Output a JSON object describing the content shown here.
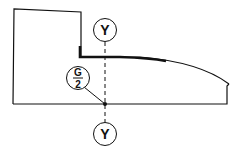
{
  "diagram": {
    "labels": {
      "top_marker": "Y",
      "bottom_marker": "Y",
      "fraction_numerator": "G",
      "fraction_denominator": "2"
    },
    "colors": {
      "stroke": "#111111",
      "background": "#ffffff"
    }
  }
}
